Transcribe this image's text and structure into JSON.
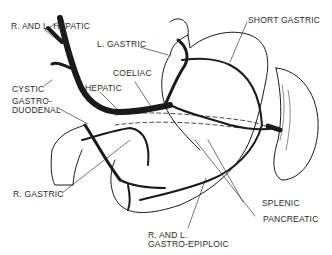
{
  "diagram": {
    "type": "anatomical-line-drawing",
    "labels": {
      "r_and_l_hepatic": "R. AND L. HEPATIC",
      "l_gastric": "L. GASTRIC",
      "short_gastric": "SHORT GASTRIC",
      "cystic": "CYSTIC",
      "coeliac": "COELIAC",
      "hepatic": "HEPATIC",
      "gastro_duodenal_1": "GASTRO-",
      "gastro_duodenal_2": "DUODENAL",
      "r_gastric": "R. GASTRIC",
      "splenic": "SPLENIC",
      "pancreatic": "PANCREATIC",
      "gastro_epiploic_1": "R. AND L.",
      "gastro_epiploic_2": "GASTRO-EPIPLOIC"
    },
    "colors": {
      "ink": "#1a1a1a",
      "background": "#ffffff"
    }
  }
}
